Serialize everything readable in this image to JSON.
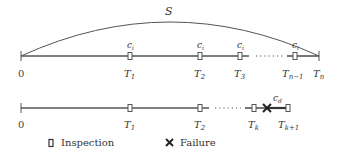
{
  "diagram": {
    "colors": {
      "line": "#555555",
      "text": "#333333",
      "background": "#ffffff"
    },
    "arc_label": "S",
    "top_timeline": {
      "origin_label": "0",
      "end_label": "T",
      "end_sub": "n",
      "inspections": [
        {
          "label": "T",
          "sub": "1",
          "cost": "c",
          "cost_sub": "i"
        },
        {
          "label": "T",
          "sub": "2",
          "cost": "c",
          "cost_sub": "i"
        },
        {
          "label": "T",
          "sub": "3",
          "cost": "c",
          "cost_sub": "i"
        },
        {
          "label": "T",
          "sub": "n−1",
          "cost": "c",
          "cost_sub": "i"
        }
      ]
    },
    "bottom_timeline": {
      "origin_label": "0",
      "inspections": [
        {
          "label": "T",
          "sub": "1"
        },
        {
          "label": "T",
          "sub": "2"
        },
        {
          "label": "T",
          "sub": "k"
        },
        {
          "label": "T",
          "sub": "k+1"
        }
      ],
      "failure_cost": "c",
      "failure_cost_sub": "d"
    },
    "legend": {
      "inspection_label": "Inspection",
      "failure_label": "Failure",
      "inspection_icon": "inspection-box-icon",
      "failure_icon": "failure-cross-icon"
    }
  }
}
